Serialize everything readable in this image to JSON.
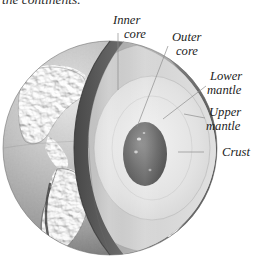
{
  "figure": {
    "caption_above": "the continents.",
    "background_color": "#ffffff"
  },
  "labels": {
    "inner_core_line1": "Inner",
    "inner_core_line2": "core",
    "outer_core_line1": "Outer",
    "outer_core_line2": "core",
    "lower_mantle_line1": "Lower",
    "lower_mantle_line2": "mantle",
    "upper_mantle_line1": "Upper",
    "upper_mantle_line2": "mantle",
    "crust": "Crust"
  },
  "colors": {
    "background": "#ffffff",
    "label_text": "#232323",
    "leader_line": "#8e8e8e",
    "crust_edge_dark": "#4a4a4a",
    "surface_mid": "#9a9a9a",
    "surface_light": "#cfcfcf",
    "upper_mantle_fill": "#b4b4b4",
    "lower_mantle_fill": "#cdcdcd",
    "outer_core_fill": "#e2e2e2",
    "inner_core_fill": "#6d6d6d",
    "rim_shadow": "#6f6f6f"
  },
  "diagram": {
    "type": "cutaway-sphere",
    "layers": [
      {
        "name": "crust",
        "label": "Crust",
        "order": 1,
        "fill": "#4a4a4a"
      },
      {
        "name": "upper-mantle",
        "label": "Upper mantle",
        "order": 2,
        "fill": "#b4b4b4"
      },
      {
        "name": "lower-mantle",
        "label": "Lower mantle",
        "order": 3,
        "fill": "#cdcdcd"
      },
      {
        "name": "outer-core",
        "label": "Outer core",
        "order": 4,
        "fill": "#e2e2e2"
      },
      {
        "name": "inner-core",
        "label": "Inner core",
        "order": 5,
        "fill": "#6d6d6d"
      }
    ],
    "globe": {
      "center_x": 110,
      "center_y": 148,
      "radius": 107
    },
    "surface_feature": "continental relief of the Americas"
  }
}
